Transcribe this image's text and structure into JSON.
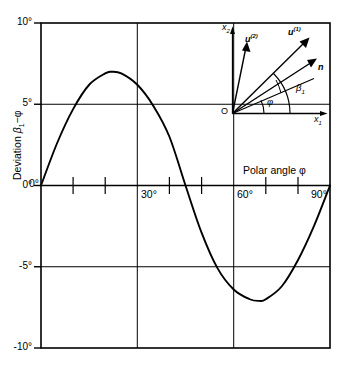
{
  "chart_data": {
    "type": "line",
    "title": "",
    "xlabel": "Polar angle φ",
    "ylabel": "Deviation β₁ − φ",
    "xlim": [
      0,
      90
    ],
    "ylim": [
      -10,
      10
    ],
    "xunit": "degrees",
    "yunit": "degrees",
    "grid": true,
    "grid_lines_x": [
      30,
      60
    ],
    "grid_lines_y": [
      5,
      0,
      -5
    ],
    "legend": "none",
    "xticks_major": [
      "0°",
      "30°",
      "60°",
      "90°"
    ],
    "xticks_major_values": [
      0,
      30,
      60,
      90
    ],
    "xticks_minor_values": [
      10,
      20,
      40,
      50,
      70,
      80
    ],
    "yticks": [
      "10°",
      "5°",
      "0°",
      "-5°",
      "-10°"
    ],
    "yticks_values": [
      10,
      5,
      0,
      -5,
      -10
    ],
    "series": [
      {
        "name": "Deviation β₁ − φ",
        "x": [
          0,
          5,
          10,
          15,
          20,
          22,
          25,
          30,
          35,
          40,
          45,
          50,
          55,
          60,
          65,
          68,
          70,
          75,
          80,
          85,
          90
        ],
        "values": [
          0,
          2.6,
          4.7,
          6.2,
          6.9,
          7.0,
          6.9,
          6.2,
          4.9,
          3.0,
          0.0,
          -2.9,
          -5.1,
          -6.4,
          -7.0,
          -7.1,
          -7.0,
          -6.2,
          -4.6,
          -2.5,
          0
        ]
      }
    ],
    "annotations": [
      {
        "name": "zero-crossing",
        "x": 45,
        "y": 0
      },
      {
        "name": "maximum",
        "x": 22,
        "y": 7.0
      },
      {
        "name": "minimum",
        "x": 68,
        "y": -7.1
      }
    ]
  },
  "axes": {
    "y_label": "Deviation β₁−φ",
    "y_label_main": "Deviation",
    "y_label_sym_beta": "β",
    "y_label_sym_sub": "1",
    "y_label_sym_rest": "−φ",
    "x_label": "Polar angle φ",
    "yticks": [
      {
        "text": "10°",
        "value": 10
      },
      {
        "text": "5°",
        "value": 5
      },
      {
        "text": "0°",
        "value": 0
      },
      {
        "text": "-5°",
        "value": -5
      },
      {
        "text": "-10°",
        "value": -10
      }
    ],
    "xticks": [
      {
        "text": "0°",
        "value": 0
      },
      {
        "text": "30°",
        "value": 30
      },
      {
        "text": "60°",
        "value": 60
      },
      {
        "text": "90°",
        "value": 90
      }
    ]
  },
  "inset": {
    "name": "vector-diagram",
    "origin_label": "O",
    "axis_x1": "x",
    "axis_x1_sub": "1",
    "axis_x2": "x",
    "axis_x2_sub": "2",
    "vector_u2": "u",
    "vector_u2_sup": "(2)",
    "vector_u1": "u",
    "vector_u1_sup": "(1)",
    "vector_n": "n",
    "angle_phi": "φ",
    "angle_beta": "β",
    "angle_beta_sub": "1"
  },
  "style": {
    "curve_color": "#000000",
    "frame_color": "#000000",
    "grid_color": "#000000",
    "background": "#ffffff"
  }
}
